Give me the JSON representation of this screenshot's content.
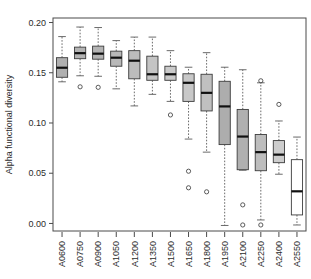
{
  "chart_data": {
    "type": "box",
    "title": "",
    "xlabel": "",
    "ylabel": "Alpha functional diversity",
    "ylim": [
      -0.005,
      0.2
    ],
    "yticks": [
      0.0,
      0.05,
      0.1,
      0.15,
      0.2
    ],
    "ytick_labels": [
      "0.00",
      "0.05",
      "0.10",
      "0.15",
      "0.20"
    ],
    "grid": false,
    "legend": "none",
    "categories": [
      "A0600",
      "A0750",
      "A0900",
      "A1050",
      "A1200",
      "A1350",
      "A1500",
      "A1650",
      "A1800",
      "A1950",
      "A2100",
      "A2250",
      "A2400",
      "A2550"
    ],
    "boxes": [
      {
        "category": "A0600",
        "whisker_low": 0.141,
        "q1": 0.1455,
        "median": 0.155,
        "q3": 0.165,
        "whisker_high": 0.186,
        "outliers": [],
        "fill": "#b0b0b0"
      },
      {
        "category": "A0750",
        "whisker_low": 0.147,
        "q1": 0.164,
        "median": 0.1695,
        "q3": 0.1755,
        "whisker_high": 0.1955,
        "outliers": [
          0.136
        ],
        "fill": "#b4b4b4"
      },
      {
        "category": "A0900",
        "whisker_low": 0.1465,
        "q1": 0.1635,
        "median": 0.169,
        "q3": 0.1765,
        "whisker_high": 0.195,
        "outliers": [
          0.1355
        ],
        "fill": "#b4b4b4"
      },
      {
        "category": "A1050",
        "whisker_low": 0.134,
        "q1": 0.1565,
        "median": 0.165,
        "q3": 0.1715,
        "whisker_high": 0.182,
        "outliers": [],
        "fill": "#b8b8b8"
      },
      {
        "category": "A1200",
        "whisker_low": 0.117,
        "q1": 0.144,
        "median": 0.162,
        "q3": 0.172,
        "whisker_high": 0.1855,
        "outliers": [],
        "fill": "#bcbcbc"
      },
      {
        "category": "A1350",
        "whisker_low": 0.1285,
        "q1": 0.1425,
        "median": 0.1485,
        "q3": 0.1665,
        "whisker_high": 0.1855,
        "outliers": [],
        "fill": "#c4c4c4"
      },
      {
        "category": "A1500",
        "whisker_low": 0.1215,
        "q1": 0.1425,
        "median": 0.1485,
        "q3": 0.1565,
        "whisker_high": 0.172,
        "outliers": [
          0.108
        ],
        "fill": "#cacaca"
      },
      {
        "category": "A1650",
        "whisker_low": 0.084,
        "q1": 0.1215,
        "median": 0.14,
        "q3": 0.149,
        "whisker_high": 0.1555,
        "outliers": [
          0.052,
          0.0355
        ],
        "fill": "#c8c8c8"
      },
      {
        "category": "A1800",
        "whisker_low": 0.071,
        "q1": 0.112,
        "median": 0.13,
        "q3": 0.1485,
        "whisker_high": 0.17,
        "outliers": [
          0.0315
        ],
        "fill": "#c0c0c0"
      },
      {
        "category": "A1950",
        "whisker_low": -0.002,
        "q1": 0.0785,
        "median": 0.1165,
        "q3": 0.1415,
        "whisker_high": 0.1555,
        "outliers": [],
        "fill": "#adadad"
      },
      {
        "category": "A2100",
        "whisker_low": 0.053,
        "q1": 0.0535,
        "median": 0.0865,
        "q3": 0.1135,
        "whisker_high": 0.153,
        "outliers": [
          0.0185,
          -0.0015
        ],
        "fill": "#b0b0b0"
      },
      {
        "category": "A2250",
        "whisker_low": 0.0035,
        "q1": 0.0525,
        "median": 0.071,
        "q3": 0.0885,
        "whisker_high": 0.14,
        "outliers": [
          0.142,
          -0.0015
        ],
        "fill": "#bdbdbd"
      },
      {
        "category": "A2400",
        "whisker_low": 0.049,
        "q1": 0.0605,
        "median": 0.0685,
        "q3": 0.0825,
        "whisker_high": 0.102,
        "outliers": [
          0.1185
        ],
        "fill": "#cdcdcd"
      },
      {
        "category": "A2550",
        "whisker_low": -0.0015,
        "q1": 0.0085,
        "median": 0.032,
        "q3": 0.0635,
        "whisker_high": 0.086,
        "outliers": [],
        "fill": "#ffffff"
      }
    ]
  },
  "axes": {
    "y_title": "Alpha functional diversity",
    "y_tick_labels": [
      "0.00",
      "0.05",
      "0.10",
      "0.15",
      "0.20"
    ],
    "x_tick_labels": [
      "A0600",
      "A0750",
      "A0900",
      "A1050",
      "A1200",
      "A1350",
      "A1500",
      "A1650",
      "A1800",
      "A1950",
      "A2100",
      "A2250",
      "A2400",
      "A2550"
    ]
  },
  "colors": {
    "axis": "#4a4a4a",
    "text": "#2b2b2b",
    "median": "#101010",
    "box_stroke": "#3c3c3c",
    "whisker": "#5a5a5a",
    "background": "#ffffff"
  }
}
